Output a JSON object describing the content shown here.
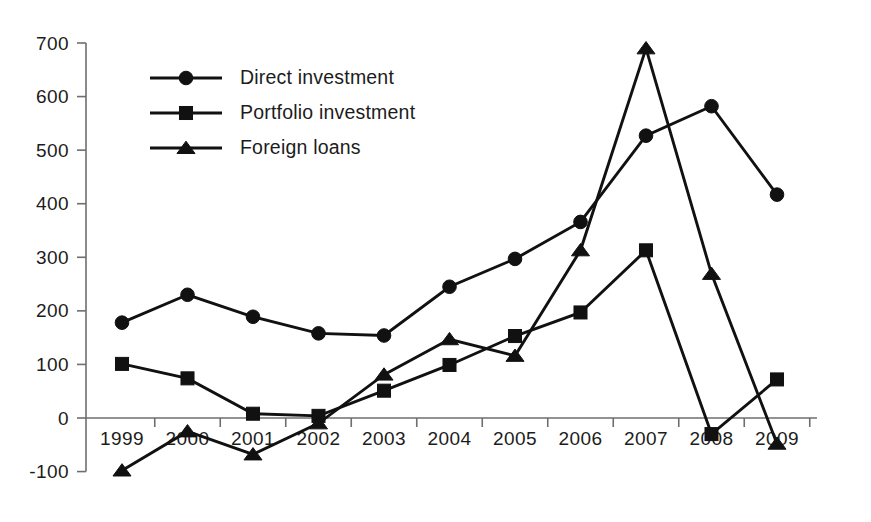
{
  "chart_data": {
    "type": "line",
    "title": "",
    "subtitle": "",
    "xlabel": "",
    "ylabel": "",
    "categories": [
      "1999",
      "2000",
      "2001",
      "2002",
      "2003",
      "2004",
      "2005",
      "2006",
      "2007",
      "2008",
      "2009"
    ],
    "x": [
      1999,
      2000,
      2001,
      2002,
      2003,
      2004,
      2005,
      2006,
      2007,
      2008,
      2009
    ],
    "series": [
      {
        "name": "Direct investment",
        "marker": "circle",
        "color": "#111111",
        "values": [
          178,
          230,
          189,
          158,
          154,
          245,
          297,
          366,
          527,
          582,
          417
        ]
      },
      {
        "name": "Portfolio investment",
        "marker": "square",
        "color": "#111111",
        "values": [
          101,
          74,
          8,
          4,
          51,
          99,
          153,
          197,
          313,
          -30,
          72
        ]
      },
      {
        "name": "Foreign loans",
        "marker": "triangle",
        "color": "#111111",
        "values": [
          -98,
          -25,
          -68,
          -10,
          81,
          147,
          116,
          313,
          690,
          269,
          -48
        ]
      }
    ],
    "ylim": [
      -100,
      700
    ],
    "yticks": [
      -100,
      0,
      100,
      200,
      300,
      400,
      500,
      600,
      700
    ],
    "ytick_labels": [
      "-100",
      "0",
      "100",
      "200",
      "300",
      "400",
      "500",
      "600",
      "700"
    ],
    "xtick_labels": [
      "1999",
      "2000",
      "2001",
      "2002",
      "2003",
      "2004",
      "2005",
      "2006",
      "2007",
      "2008",
      "2009"
    ],
    "grid": false,
    "legend_position": "top-left-inside",
    "legend_entries": [
      "Direct investment",
      "Portfolio investment",
      "Foreign loans"
    ],
    "axis_color": "#6e6e6e",
    "line_color": "#111111"
  },
  "legend": {
    "items": [
      {
        "label": "Direct investment",
        "marker": "circle-marker"
      },
      {
        "label": "Portfolio investment",
        "marker": "square-marker"
      },
      {
        "label": "Foreign loans",
        "marker": "triangle-marker"
      }
    ]
  }
}
